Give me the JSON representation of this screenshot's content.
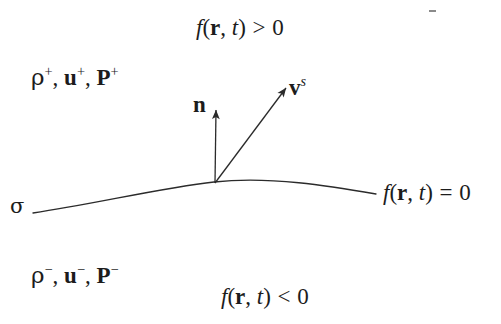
{
  "figure": {
    "type": "physics-interface-diagram",
    "background_color": "#ffffff",
    "stroke_color": "#2b2b2b",
    "text_color": "#1c1c1c"
  },
  "labels": {
    "f_positive": {
      "id": "f-positive",
      "f": "f",
      "open": "(",
      "r": "r",
      "comma": ", ",
      "t": "t",
      "close": ")",
      "operator": " > ",
      "value": "0",
      "full_text": "f(r, t) > 0"
    },
    "f_zero": {
      "id": "f-zero",
      "f": "f",
      "open": "(",
      "r": "r",
      "comma": ", ",
      "t": "t",
      "close": ")",
      "operator": " = ",
      "value": "0",
      "full_text": "f(r, t) = 0"
    },
    "f_negative": {
      "id": "f-negative",
      "f": "f",
      "open": "(",
      "r": "r",
      "comma": ", ",
      "t": "t",
      "close": ")",
      "operator": " < ",
      "value": "0",
      "full_text": "f(r, t) < 0"
    },
    "upper_state": {
      "id": "upper-state-variables",
      "rho": "ρ",
      "rho_sup": "+",
      "sep1": ", ",
      "u": "u",
      "u_sup": "+",
      "sep2": ", ",
      "P": "P",
      "P_sup": "+",
      "full_text": "ρ+, u+, P+"
    },
    "lower_state": {
      "id": "lower-state-variables",
      "rho": "ρ",
      "rho_sup": "−",
      "sep1": ", ",
      "u": "u",
      "u_sup": "−",
      "sep2": ", ",
      "P": "P",
      "P_sup": "−",
      "full_text": "ρ−, u−, P−"
    },
    "normal_vector": {
      "id": "normal-vector-label",
      "symbol": "n"
    },
    "surface_velocity": {
      "id": "surface-velocity-label",
      "symbol": "v",
      "superscript": "s",
      "full_text": "v^s"
    },
    "surface_sigma": {
      "id": "surface-sigma-label",
      "symbol": "σ"
    }
  },
  "geometry": {
    "interface_curve": {
      "name": "interface-curve",
      "path": "M 33 213 C 95 204 160 188 214 182 C 270 176 330 186 376 194",
      "stroke_width": 1.3
    },
    "normal_arrow": {
      "name": "normal-arrow",
      "x1": 215,
      "y1": 183,
      "x2": 216,
      "y2": 110,
      "stroke_width": 1.3
    },
    "velocity_arrow": {
      "name": "velocity-arrow",
      "x1": 215,
      "y1": 183,
      "x2": 286,
      "y2": 88,
      "stroke_width": 1.3
    },
    "artifact_mark": {
      "name": "speck-artifact",
      "x": 429,
      "y": 10,
      "width": 7,
      "height": 2
    }
  }
}
